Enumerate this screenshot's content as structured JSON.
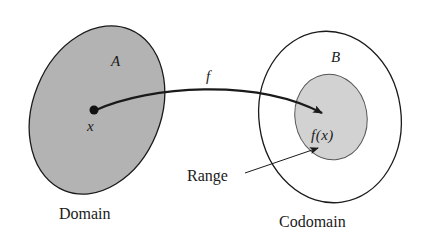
{
  "diagram": {
    "domain_set": {
      "name": "A",
      "caption": "Domain",
      "fill": "#b3b3b3"
    },
    "codomain_set": {
      "name": "B",
      "caption": "Codomain",
      "fill": "#ffffff"
    },
    "range_set": {
      "caption": "Range",
      "fill": "#d2d2d2"
    },
    "element": {
      "label": "x"
    },
    "image": {
      "label": "f(x)"
    },
    "mapping": {
      "label": "f"
    },
    "colors": {
      "stroke": "#1a1a1a",
      "domain_fill": "#b3b3b3",
      "range_fill": "#d2d2d2",
      "background": "#ffffff"
    }
  }
}
